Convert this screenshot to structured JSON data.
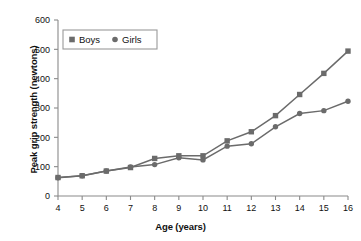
{
  "chart_data": {
    "type": "line",
    "title": "",
    "xlabel": "Age (years)",
    "ylabel": "Peak grip strength (newtons)",
    "x": [
      4,
      5,
      6,
      7,
      8,
      9,
      10,
      11,
      12,
      13,
      14,
      15,
      16
    ],
    "xtick_labels": [
      "4",
      "5",
      "6",
      "7",
      "8",
      "9",
      "10",
      "11",
      "12",
      "13",
      "14",
      "15",
      "16"
    ],
    "ytick_labels": [
      "0",
      "100",
      "200",
      "300",
      "400",
      "500",
      "600"
    ],
    "ytick_values": [
      0,
      100,
      200,
      300,
      400,
      500,
      600
    ],
    "xlim": [
      4,
      16
    ],
    "ylim": [
      0,
      600
    ],
    "grid": false,
    "legend_position": "upper-left",
    "series": [
      {
        "name": "Boys",
        "marker": "square",
        "color": "#6b6b6b",
        "values": [
          63,
          69,
          85,
          97,
          128,
          137,
          137,
          188,
          219,
          274,
          346,
          418,
          494
        ]
      },
      {
        "name": "Girls",
        "marker": "circle",
        "color": "#6b6b6b",
        "values": [
          62,
          69,
          85,
          99,
          107,
          130,
          123,
          170,
          178,
          236,
          281,
          291,
          323
        ]
      }
    ]
  },
  "legend": {
    "entries": [
      {
        "label": "Boys",
        "marker": "square"
      },
      {
        "label": "Girls",
        "marker": "circle"
      }
    ]
  },
  "colors": {
    "series": "#6b6b6b",
    "axis": "#8a8a8a",
    "text": "#111111",
    "background": "#ffffff"
  }
}
